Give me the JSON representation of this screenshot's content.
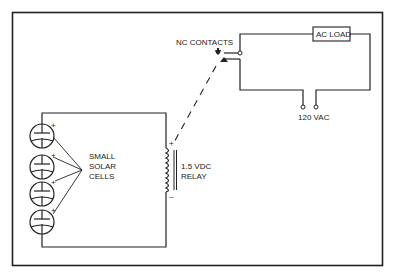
{
  "diagram": {
    "labels": {
      "nc_contacts": "NC CONTACTS",
      "ac_load": "AC LOAD",
      "supply": "120 VAC",
      "relay_line1": "1.5 VDC",
      "relay_line2": "RELAY",
      "cells_line1": "SMALL",
      "cells_line2": "SOLAR",
      "cells_line3": "CELLS",
      "plus": "+",
      "minus": "–"
    },
    "components": [
      {
        "id": "solar-cells",
        "type": "solar cell array",
        "count": 4,
        "connection": "series"
      },
      {
        "id": "relay",
        "type": "relay coil",
        "rating": "1.5 VDC"
      },
      {
        "id": "nc-contacts",
        "type": "normally closed contacts"
      },
      {
        "id": "ac-load",
        "type": "load"
      },
      {
        "id": "ac-supply",
        "type": "AC terminals",
        "rating": "120 VAC"
      }
    ],
    "connections": [
      {
        "from": "solar-cells",
        "to": "relay",
        "type": "wire"
      },
      {
        "from": "relay",
        "to": "nc-contacts",
        "type": "mechanical link (dashed)"
      },
      {
        "from": "nc-contacts",
        "to": "ac-load",
        "type": "wire"
      },
      {
        "from": "ac-load",
        "to": "ac-supply",
        "type": "wire"
      }
    ],
    "colors": {
      "ink": "#222222",
      "background": "#ffffff"
    }
  }
}
